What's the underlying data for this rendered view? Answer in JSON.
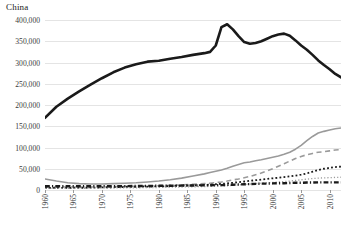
{
  "chart_data": {
    "type": "line",
    "title": "China",
    "xlabel": "",
    "ylabel": "",
    "xlim": [
      1960,
      2012
    ],
    "ylim": [
      0,
      400000
    ],
    "ytick_labels": [
      "400,000",
      "350,000",
      "300,000",
      "250,000",
      "200,000",
      "150,000",
      "100,000",
      "50,000",
      "0"
    ],
    "ytick_values": [
      400000,
      350000,
      300000,
      250000,
      200000,
      150000,
      100000,
      50000,
      0
    ],
    "xtick_labels": [
      "1960",
      "1965",
      "1970",
      "1975",
      "1980",
      "1985",
      "1990",
      "1995",
      "2000",
      "2005",
      "2010"
    ],
    "xtick_values": [
      1960,
      1965,
      1970,
      1975,
      1980,
      1985,
      1990,
      1995,
      2000,
      2005,
      2010
    ],
    "grid": true,
    "legend": "none",
    "x": [
      1960,
      1962,
      1964,
      1966,
      1968,
      1970,
      1972,
      1974,
      1976,
      1978,
      1980,
      1982,
      1984,
      1986,
      1988,
      1989,
      1990,
      1991,
      1992,
      1993,
      1994,
      1995,
      1996,
      1997,
      1998,
      1999,
      2000,
      2001,
      2002,
      2003,
      2004,
      2005,
      2006,
      2007,
      2008,
      2009,
      2010,
      2011,
      2012
    ],
    "series": [
      {
        "name": "series-1-thick-black",
        "style": "solid",
        "color": "#1a1a1a",
        "width": 2.6,
        "values": [
          170000,
          196000,
          215000,
          232000,
          248000,
          263000,
          277000,
          288000,
          296000,
          302000,
          304000,
          309000,
          313000,
          318000,
          322000,
          325000,
          340000,
          383000,
          390000,
          378000,
          362000,
          348000,
          344000,
          346000,
          350000,
          356000,
          362000,
          366000,
          368000,
          363000,
          352000,
          340000,
          330000,
          318000,
          305000,
          294000,
          284000,
          273000,
          265000
        ]
      },
      {
        "name": "series-2-solid-gray",
        "style": "solid",
        "color": "#9a9a9a",
        "width": 1.6,
        "values": [
          26000,
          21000,
          17000,
          15000,
          14000,
          14000,
          15000,
          16000,
          17000,
          19000,
          21000,
          24000,
          28000,
          33000,
          38000,
          41000,
          44000,
          47000,
          51000,
          56000,
          60000,
          64000,
          66000,
          69000,
          71000,
          74000,
          77000,
          80000,
          84000,
          89000,
          96000,
          105000,
          116000,
          126000,
          134000,
          138000,
          141000,
          144000,
          146000
        ]
      },
      {
        "name": "series-3-dashed-gray",
        "style": "dashed",
        "color": "#9a9a9a",
        "width": 1.6,
        "values": [
          7000,
          7000,
          7000,
          7000,
          7000,
          7500,
          8000,
          8500,
          9000,
          9500,
          10000,
          11000,
          12000,
          13500,
          15000,
          16000,
          17500,
          19000,
          21000,
          23500,
          26000,
          29000,
          32000,
          36000,
          40000,
          45000,
          50000,
          56000,
          62000,
          68000,
          74000,
          79000,
          83000,
          86000,
          89000,
          90000,
          92000,
          94000,
          95000
        ]
      },
      {
        "name": "series-4-dotted-black",
        "style": "dotted",
        "color": "#1a1a1a",
        "width": 1.8,
        "values": [
          5000,
          5000,
          5000,
          5000,
          5500,
          6000,
          6500,
          7000,
          7500,
          8000,
          8500,
          9000,
          10000,
          11000,
          12000,
          12500,
          13500,
          14500,
          15500,
          17000,
          18500,
          20000,
          21500,
          23000,
          24500,
          26000,
          27500,
          29000,
          30500,
          32000,
          34000,
          36000,
          39000,
          43000,
          47000,
          50000,
          52000,
          54000,
          55000
        ]
      },
      {
        "name": "series-5-fine-dotted-gray",
        "style": "fine-dotted",
        "color": "#9a9a9a",
        "width": 1.3,
        "values": [
          4000,
          4000,
          4000,
          4000,
          4200,
          4500,
          4800,
          5000,
          5200,
          5500,
          6000,
          6500,
          7000,
          7500,
          8000,
          8500,
          9000,
          9500,
          10000,
          11000,
          12000,
          13000,
          14000,
          15000,
          16000,
          17000,
          18000,
          19000,
          20000,
          21000,
          22500,
          24000,
          25500,
          27000,
          28000,
          28500,
          29000,
          29500,
          30000
        ]
      },
      {
        "name": "series-6-thick-dashdot-black",
        "style": "dash-dot",
        "color": "#1a1a1a",
        "width": 2.4,
        "values": [
          9000,
          9000,
          9000,
          9000,
          9000,
          9000,
          9000,
          9000,
          9500,
          9500,
          10000,
          10000,
          10500,
          10500,
          11000,
          11000,
          11500,
          11500,
          12000,
          12500,
          13000,
          13500,
          14000,
          14500,
          15000,
          15000,
          15500,
          16000,
          16000,
          16500,
          17000,
          17000,
          17500,
          17500,
          18000,
          18000,
          18000,
          18000,
          18000
        ]
      }
    ]
  }
}
